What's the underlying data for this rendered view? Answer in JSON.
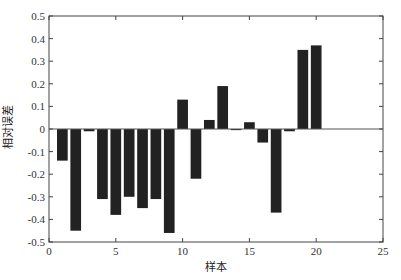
{
  "chart_data": {
    "type": "bar",
    "title": "",
    "xlabel": "样本",
    "ylabel": "相对误差",
    "x": [
      1,
      2,
      3,
      4,
      5,
      6,
      7,
      8,
      9,
      10,
      11,
      12,
      13,
      14,
      15,
      16,
      17,
      18,
      19,
      20
    ],
    "values": [
      -0.14,
      -0.45,
      -0.01,
      -0.31,
      -0.38,
      -0.3,
      -0.35,
      -0.31,
      -0.46,
      0.13,
      -0.22,
      0.04,
      0.19,
      -0.005,
      0.03,
      -0.06,
      -0.37,
      -0.01,
      0.35,
      0.37
    ],
    "xlim": [
      0,
      25
    ],
    "ylim": [
      -0.5,
      0.5
    ],
    "xticks": [
      0,
      5,
      10,
      15,
      20,
      25
    ],
    "xtick_labels": [
      "0",
      "5",
      "10",
      "15",
      "20",
      "25"
    ],
    "yticks": [
      -0.5,
      -0.4,
      -0.3,
      -0.2,
      -0.1,
      0,
      0.1,
      0.2,
      0.3,
      0.4,
      0.5
    ],
    "ytick_labels": [
      "-0.5",
      "-0.4",
      "-0.3",
      "-0.2",
      "-0.1",
      "0",
      "0.1",
      "0.2",
      "0.3",
      "0.4",
      "0.5"
    ],
    "bar_color": "#222222",
    "grid": false,
    "legend": null,
    "zero_line": true
  }
}
